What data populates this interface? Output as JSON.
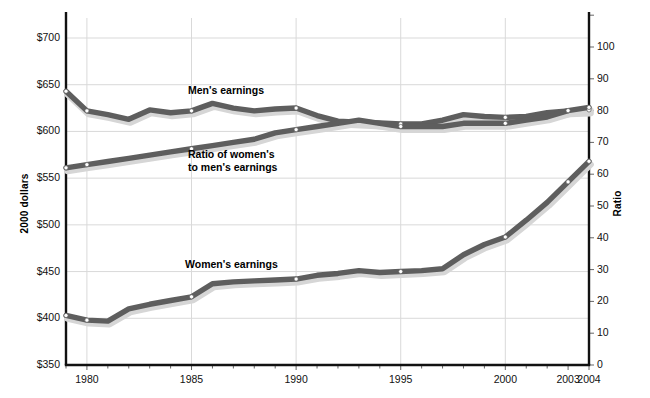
{
  "axes": {
    "left": {
      "title": "2000 dollars",
      "ticks": [
        "$700",
        "$650",
        "$600",
        "$550",
        "$500",
        "$450",
        "$400",
        "$350"
      ],
      "min": 350,
      "max": 700,
      "step": 50
    },
    "right": {
      "title": "Ratio",
      "ticks": [
        "100",
        "90",
        "80",
        "70",
        "60",
        "50",
        "40",
        "30",
        "20",
        "10",
        "0"
      ],
      "min": 0,
      "max": 110,
      "step": 10
    },
    "x": {
      "ticks": [
        "1980",
        "1985",
        "1990",
        "1995",
        "2000",
        "2003",
        "2004"
      ],
      "min": 1979,
      "max": 2004
    }
  },
  "labels": {
    "mens": "Men's earnings",
    "ratio_line1": "Ratio of women's",
    "ratio_line2": "to men's earnings",
    "womens": "Women's earnings"
  },
  "colors": {
    "line": "#5e5e5e",
    "shadow": "#d6d6d6",
    "grid": "#d9d9d9",
    "axis": "#111111",
    "marker": "#ffffff"
  },
  "chart_data": {
    "type": "line",
    "title": "",
    "xlabel": "",
    "ylabel": "2000 dollars",
    "y2label": "Ratio",
    "xlim": [
      1979,
      2004
    ],
    "ylim": [
      350,
      700
    ],
    "y2lim": [
      0,
      110
    ],
    "grid": true,
    "legend": "inline-annotations",
    "x": [
      1979,
      1980,
      1981,
      1982,
      1983,
      1984,
      1985,
      1986,
      1987,
      1988,
      1989,
      1990,
      1991,
      1992,
      1993,
      1994,
      1995,
      1996,
      1997,
      1998,
      1999,
      2000,
      2001,
      2002,
      2003,
      2004
    ],
    "series": [
      {
        "name": "Men's earnings",
        "axis": "left",
        "units": "2000 dollars",
        "values": [
          643,
          622,
          618,
          613,
          623,
          620,
          622,
          630,
          625,
          622,
          624,
          625,
          617,
          611,
          610,
          609,
          608,
          608,
          612,
          618,
          616,
          615,
          616,
          620,
          622,
          623
        ]
      },
      {
        "name": "Ratio of women's to men's earnings",
        "axis": "right",
        "units": "percent",
        "values": [
          62,
          63,
          64,
          65,
          66,
          67,
          68,
          69,
          70,
          71,
          73,
          74,
          75,
          76,
          77,
          76,
          75,
          75,
          75,
          76,
          76,
          76,
          77,
          78,
          80,
          81
        ]
      },
      {
        "name": "Women's earnings",
        "axis": "left",
        "units": "2000 dollars",
        "values": [
          403,
          398,
          397,
          410,
          415,
          419,
          423,
          437,
          439,
          440,
          441,
          442,
          446,
          448,
          451,
          449,
          450,
          451,
          453,
          468,
          479,
          487,
          505,
          524,
          546,
          568
        ]
      }
    ]
  }
}
